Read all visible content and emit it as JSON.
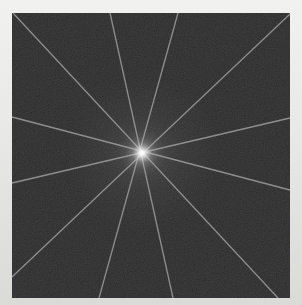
{
  "canvas": {
    "width": 302,
    "height": 305,
    "mat_color_top": "#f1f1ef",
    "mat_color_bottom": "#dadad7"
  },
  "spectrum": {
    "left": 12,
    "top": 13,
    "width": 278,
    "height": 285,
    "viewbox": "0 0 278 285",
    "background_color": "#1b1b1b",
    "noise_opacity": 0.17,
    "line_color": "#9a9a9a",
    "line_width": 1.3,
    "line_opacity": 0.88,
    "center": {
      "x": 130,
      "y": 140,
      "core_color": "#ffffff",
      "glow_color": "#e6e6e6",
      "halo_color": "#9a9a9a"
    },
    "lines": [
      {
        "name": "ray-line-diagonal-tlbr",
        "x1": 1,
        "y1": 0,
        "x2": 266,
        "y2": 285
      },
      {
        "name": "ray-line-diagonal-trbl",
        "x1": 278,
        "y1": 1,
        "x2": 0,
        "y2": 264
      },
      {
        "name": "ray-line-shallow-down",
        "x1": 0,
        "y1": 104,
        "x2": 278,
        "y2": 177
      },
      {
        "name": "ray-line-shallow-up",
        "x1": 0,
        "y1": 170,
        "x2": 278,
        "y2": 105
      },
      {
        "name": "ray-line-steep-right",
        "x1": 98,
        "y1": 0,
        "x2": 161,
        "y2": 285
      },
      {
        "name": "ray-line-steep-left",
        "x1": 166,
        "y1": 0,
        "x2": 87,
        "y2": 285
      }
    ]
  }
}
